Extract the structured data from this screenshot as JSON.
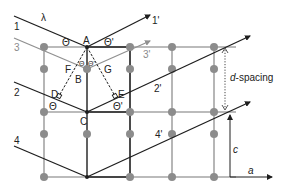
{
  "diagram": {
    "rays": {
      "incident": [
        {
          "id": "1",
          "label": "1",
          "color": "#222222"
        },
        {
          "id": "3",
          "label": "3",
          "color": "#8a8a8a"
        },
        {
          "id": "2",
          "label": "2",
          "color": "#222222"
        },
        {
          "id": "4",
          "label": "4",
          "color": "#222222"
        }
      ],
      "diffracted": [
        {
          "id": "1p",
          "label": "1'",
          "color": "#222222"
        },
        {
          "id": "3p",
          "label": "3'",
          "color": "#8a8a8a"
        },
        {
          "id": "2p",
          "label": "2'",
          "color": "#222222"
        },
        {
          "id": "4p",
          "label": "4'",
          "color": "#222222"
        }
      ]
    },
    "wavelength_label": "λ",
    "points": {
      "A": "A",
      "B": "B",
      "C": "C",
      "D": "D",
      "E": "E",
      "F": "F",
      "G": "G"
    },
    "angles": {
      "theta": "Θ",
      "theta_prime": "Θ'",
      "theta_left_top": "Θ",
      "theta_right_top": "Θ'",
      "theta_left_bottom": "Θ",
      "theta_right_bottom": "Θ'",
      "theta_inner_left": "Θ",
      "theta_inner_right": "Θ'"
    },
    "d_spacing_label_italic": "d",
    "d_spacing_label_rest": "-spacing",
    "axes": {
      "c": "c",
      "a": "a"
    },
    "colors": {
      "lattice": "#9a9a9a",
      "lattice_dot": "#8c8c8c",
      "ray": "#1e1e1e",
      "ray_gray": "#909090",
      "cell_outline": "#1e1e1e"
    }
  }
}
